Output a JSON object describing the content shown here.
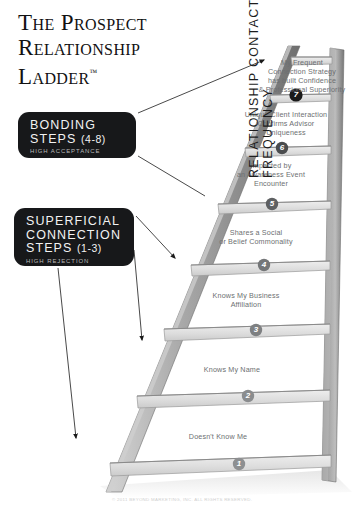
{
  "title": {
    "line1": "The Prospect",
    "line2": "Relationship",
    "line3": "Ladder",
    "trademark": "™"
  },
  "callouts": [
    {
      "id": "bonding",
      "line1": "BONDING",
      "line2": "STEPS",
      "range": "(4-8)",
      "subtitle": "HIGH ACCEPTANCE"
    },
    {
      "id": "superficial",
      "line1": "SUPERFICIAL",
      "line2": "CONNECTION",
      "line3": "STEPS",
      "range": "(1-3)",
      "subtitle": "HIGH REJECTION"
    }
  ],
  "axis": {
    "label": "RELATIONSHIP CONTACT FREQUENCY"
  },
  "ladder": {
    "steps": [
      {
        "number": "1",
        "label": "Doesn't Know Me"
      },
      {
        "number": "2",
        "label": "Knows My Name"
      },
      {
        "number": "3",
        "label": "Knows My Business\nAffiliation"
      },
      {
        "number": "4",
        "label": "Shares a Social\nor Belief Commonality"
      },
      {
        "number": "5",
        "label": "Impacted by\nan Awareness Event\nEncounter"
      },
      {
        "number": "6",
        "label": "Unique Client Interaction\nConfirms Advisor\nUniqueness"
      },
      {
        "number": "7",
        "label": "My Frequent\nConnection Strategy\nhas built Confidence\n& Professional Superiority"
      }
    ]
  },
  "footer": {
    "copyright": "© 2011 BEYOND MARKETING, INC. ALL RIGHTS RESERVED."
  },
  "colors": {
    "callout_bg": "#17181a",
    "rung_face": "#dcdcdc",
    "rung_edge": "#9a9a9a",
    "rail_dark": "#7c7c7c",
    "rail_light": "#c9c9c9",
    "badge_dark": "#1a1a1a",
    "badge_gray": "#8d8f91",
    "text_gray": "#6d6f72",
    "title_black": "#111111"
  }
}
